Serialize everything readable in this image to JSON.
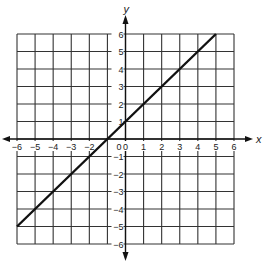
{
  "chart_data": {
    "type": "line",
    "title": "",
    "xlabel": "x",
    "ylabel": "y",
    "xlim": [
      -6,
      6
    ],
    "ylim": [
      -6,
      6
    ],
    "grid": true,
    "x_ticks": [
      -6,
      -5,
      -4,
      -3,
      -2,
      -1,
      0,
      1,
      2,
      3,
      4,
      5,
      6
    ],
    "y_ticks": [
      -6,
      -5,
      -4,
      -3,
      -2,
      -1,
      0,
      1,
      2,
      3,
      4,
      5,
      6
    ],
    "x_tick_labels": [
      "−6",
      "−5",
      "−4",
      "−3",
      "−2",
      "",
      "0",
      "1",
      "2",
      "3",
      "4",
      "5",
      "6"
    ],
    "y_tick_labels": [
      "−6",
      "−5",
      "−4",
      "−3",
      "−2",
      "−1",
      "",
      "1",
      "2",
      "3",
      "4",
      "5",
      "6"
    ],
    "origin_label": "0",
    "series": [
      {
        "name": "y = x + 1",
        "equation": "y = x + 1",
        "x": [
          -6,
          5
        ],
        "y": [
          -5,
          6
        ]
      }
    ],
    "colors": {
      "line": "#111111",
      "grid": "#333333",
      "axis": "#111111"
    }
  }
}
